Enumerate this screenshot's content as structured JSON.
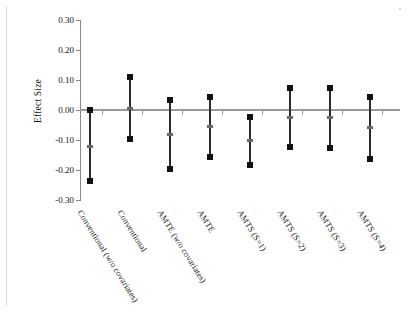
{
  "chart_data": {
    "type": "scatter",
    "title": "",
    "xlabel": "",
    "ylabel": "Effect Size",
    "ylim": [
      -0.3,
      0.3
    ],
    "ytick_labels": [
      "0.30",
      "0.20",
      "0.10",
      "0.00",
      "-0.10",
      "-0.20",
      "-0.30"
    ],
    "ytick_values": [
      0.3,
      0.2,
      0.1,
      0.0,
      -0.1,
      -0.2,
      -0.3
    ],
    "grid": false,
    "legend": "none",
    "zero_reference_line": 0.0,
    "categories": [
      "Conventional (w/o covariates)",
      "Conventional",
      "AMTE (w/o covariates)",
      "AMTE",
      "AMTS (S=1)",
      "AMTS (S=2)",
      "AMTS (S=3)",
      "AMTS (S=4)"
    ],
    "series": [
      {
        "name": "Effect size with 95% interval",
        "points": [
          {
            "category": "Conventional (w/o covariates)",
            "upper": 0.0,
            "estimate": -0.12,
            "lower": -0.235
          },
          {
            "category": "Conventional",
            "upper": 0.11,
            "estimate": 0.005,
            "lower": -0.098
          },
          {
            "category": "AMTE (w/o covariates)",
            "upper": 0.035,
            "estimate": -0.08,
            "lower": -0.195
          },
          {
            "category": "AMTE",
            "upper": 0.045,
            "estimate": -0.055,
            "lower": -0.158
          },
          {
            "category": "AMTS (S=1)",
            "upper": -0.022,
            "estimate": -0.102,
            "lower": -0.182
          },
          {
            "category": "AMTS (S=2)",
            "upper": 0.072,
            "estimate": -0.025,
            "lower": -0.124
          },
          {
            "category": "AMTS (S=3)",
            "upper": 0.074,
            "estimate": -0.026,
            "lower": -0.128
          },
          {
            "category": "AMTS (S=4)",
            "upper": 0.045,
            "estimate": -0.058,
            "lower": -0.164
          }
        ]
      }
    ],
    "colors": {
      "marker": "#111111",
      "bar": "#2b2b2b",
      "midpoint": "#6a6a6a",
      "axis": "#8a8a8a",
      "zero_line": "#9a9a9a",
      "background": "#ffffff",
      "text": "#111111"
    }
  }
}
